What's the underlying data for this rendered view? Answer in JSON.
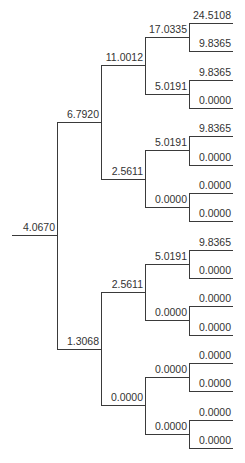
{
  "diagram": {
    "type": "binomial-tree",
    "colors": {
      "line": "#3a3a3a",
      "text": "#333333",
      "background": "#ffffff"
    },
    "root": {
      "value": "4.0670",
      "children": [
        {
          "value": "6.7920",
          "children": [
            {
              "value": "11.0012",
              "children": [
                {
                  "value": "17.0335",
                  "children": [
                    {
                      "value": "24.5108"
                    },
                    {
                      "value": "9.8365"
                    }
                  ]
                },
                {
                  "value": "5.0191",
                  "children": [
                    {
                      "value": "9.8365"
                    },
                    {
                      "value": "0.0000"
                    }
                  ]
                }
              ]
            },
            {
              "value": "2.5611",
              "children": [
                {
                  "value": "5.0191",
                  "children": [
                    {
                      "value": "9.8365"
                    },
                    {
                      "value": "0.0000"
                    }
                  ]
                },
                {
                  "value": "0.0000",
                  "children": [
                    {
                      "value": "0.0000"
                    },
                    {
                      "value": "0.0000"
                    }
                  ]
                }
              ]
            }
          ]
        },
        {
          "value": "1.3068",
          "children": [
            {
              "value": "2.5611",
              "children": [
                {
                  "value": "5.0191",
                  "children": [
                    {
                      "value": "9.8365"
                    },
                    {
                      "value": "0.0000"
                    }
                  ]
                },
                {
                  "value": "0.0000",
                  "children": [
                    {
                      "value": "0.0000"
                    },
                    {
                      "value": "0.0000"
                    }
                  ]
                }
              ]
            },
            {
              "value": "0.0000",
              "children": [
                {
                  "value": "0.0000",
                  "children": [
                    {
                      "value": "0.0000"
                    },
                    {
                      "value": "0.0000"
                    }
                  ]
                },
                {
                  "value": "0.0000",
                  "children": [
                    {
                      "value": "0.0000"
                    },
                    {
                      "value": "0.0000"
                    }
                  ]
                }
              ]
            }
          ]
        }
      ]
    }
  }
}
